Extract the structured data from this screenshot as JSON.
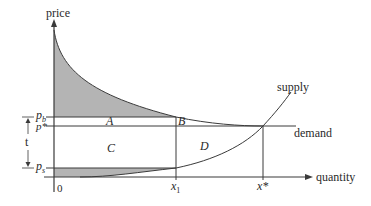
{
  "diagram": {
    "type": "supply-demand-tax-incidence",
    "axes": {
      "y_label": "price",
      "x_label": "quantity"
    },
    "price_levels": {
      "buyer_price": {
        "label": "p",
        "sub": "b"
      },
      "equilibrium_price": {
        "label": "p*"
      },
      "seller_price": {
        "label": "p",
        "sub": "s"
      }
    },
    "quantity_levels": {
      "origin": "0",
      "taxed_quantity": {
        "label": "x",
        "sub": "1"
      },
      "equilibrium_quantity": {
        "label": "x*"
      }
    },
    "tax_label": "t",
    "curves": {
      "supply": "supply",
      "demand": "demand"
    },
    "regions": {
      "A": "A",
      "B": "B",
      "C": "C",
      "D": "D"
    },
    "colors": {
      "line": "#3a3a3a",
      "shade": "#b4b4b4",
      "background": "#ffffff"
    }
  }
}
